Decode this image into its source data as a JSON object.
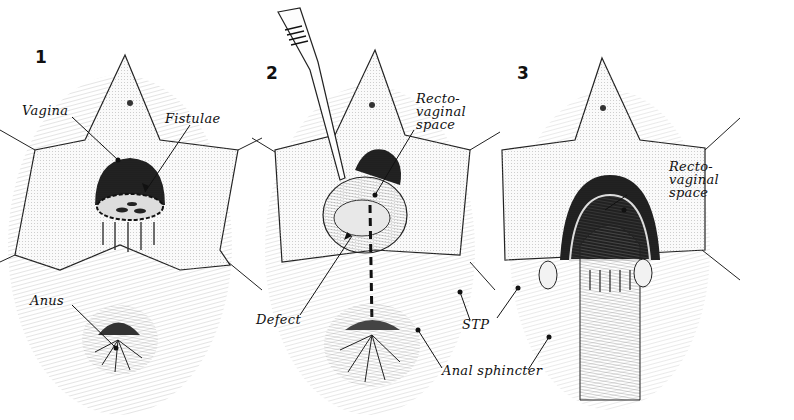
{
  "figure": {
    "panels": [
      {
        "number": "1",
        "labels": {
          "vagina": "Vagina",
          "fistulae": "Fistulae",
          "anus": "Anus"
        }
      },
      {
        "number": "2",
        "instrument": "forceps",
        "labels": {
          "rectovaginal_space": "Recto-\nvaginal\nspace",
          "defect": "Defect",
          "stp": "STP",
          "anal_sphincter": "Anal sphincter"
        }
      },
      {
        "number": "3",
        "labels": {
          "rectovaginal_space": "Recto-\nvaginal\nspace"
        }
      }
    ]
  },
  "colors": {
    "ink": "#111111",
    "background": "#ffffff",
    "shade": "#2a2a2a",
    "tissue": "#f4f4f4"
  }
}
